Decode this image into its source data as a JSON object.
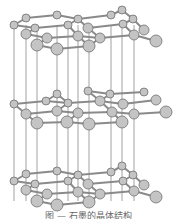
{
  "figure": {
    "title": "石墨的晶体结构",
    "caption": "图 — 石墨的晶体结构",
    "colors": {
      "atom_fill": "#c4c4c4",
      "atom_stroke": "#707070",
      "bond": "#8a8a8a",
      "interlayer_line": "#8a8a8a",
      "caption": "#666666"
    },
    "vertical_lines_x": [
      14,
      26,
      37,
      57,
      68,
      78,
      89,
      111,
      122,
      134
    ],
    "vertical_line_range": [
      25,
      201
    ],
    "layers": [
      {
        "name": "top",
        "atoms": [
          [
            14,
            25,
            4
          ],
          [
            26,
            18,
            4
          ],
          [
            57,
            15,
            4
          ],
          [
            78,
            19,
            4
          ],
          [
            111,
            15,
            4
          ],
          [
            122,
            10,
            4
          ],
          [
            133,
            19,
            4
          ],
          [
            144,
            30,
            5
          ],
          [
            68,
            25,
            4
          ],
          [
            88,
            28,
            5
          ],
          [
            123,
            24,
            4
          ],
          [
            35,
            28,
            4
          ],
          [
            26,
            34,
            5
          ],
          [
            47,
            38,
            5
          ],
          [
            78,
            36,
            5
          ],
          [
            100,
            38,
            5
          ],
          [
            134,
            35,
            5
          ],
          [
            156,
            41,
            6
          ],
          [
            37,
            45,
            6
          ],
          [
            57,
            49,
            6
          ],
          [
            89,
            46,
            6
          ]
        ],
        "bonds": [
          [
            0,
            1
          ],
          [
            1,
            2
          ],
          [
            2,
            3
          ],
          [
            3,
            8
          ],
          [
            8,
            11
          ],
          [
            11,
            0
          ],
          [
            3,
            4
          ],
          [
            4,
            5
          ],
          [
            5,
            6
          ],
          [
            6,
            10
          ],
          [
            10,
            9
          ],
          [
            9,
            3
          ],
          [
            6,
            7
          ],
          [
            10,
            16
          ],
          [
            11,
            12
          ],
          [
            12,
            13
          ],
          [
            13,
            14
          ],
          [
            14,
            8
          ],
          [
            14,
            15
          ],
          [
            15,
            16
          ],
          [
            16,
            17
          ],
          [
            13,
            18
          ],
          [
            18,
            19
          ],
          [
            19,
            20
          ],
          [
            20,
            14
          ],
          [
            9,
            15
          ],
          [
            15,
            20
          ]
        ]
      },
      {
        "name": "middle",
        "atoms": [
          [
            14,
            104,
            4
          ],
          [
            46,
            101,
            4
          ],
          [
            57,
            94,
            4
          ],
          [
            68,
            103,
            4
          ],
          [
            88,
            91,
            4
          ],
          [
            110,
            94,
            4
          ],
          [
            144,
            92,
            4
          ],
          [
            100,
            101,
            5
          ],
          [
            123,
            104,
            5
          ],
          [
            156,
            100,
            5
          ],
          [
            26,
            114,
            5
          ],
          [
            57,
            111,
            5
          ],
          [
            78,
            113,
            5
          ],
          [
            112,
            112,
            5
          ],
          [
            134,
            114,
            5
          ],
          [
            166,
            112,
            6
          ],
          [
            37,
            123,
            6
          ],
          [
            67,
            122,
            6
          ],
          [
            89,
            124,
            6
          ],
          [
            122,
            122,
            6
          ]
        ],
        "bonds": [
          [
            0,
            1
          ],
          [
            1,
            2
          ],
          [
            2,
            3
          ],
          [
            1,
            3
          ],
          [
            3,
            7
          ],
          [
            4,
            5
          ],
          [
            5,
            6
          ],
          [
            5,
            7
          ],
          [
            7,
            8
          ],
          [
            8,
            9
          ],
          [
            10,
            11
          ],
          [
            11,
            12
          ],
          [
            12,
            13
          ],
          [
            13,
            14
          ],
          [
            14,
            15
          ],
          [
            11,
            3
          ],
          [
            13,
            7
          ],
          [
            16,
            17
          ],
          [
            17,
            18
          ],
          [
            18,
            19
          ],
          [
            17,
            12
          ],
          [
            19,
            13
          ],
          [
            10,
            16
          ],
          [
            0,
            10
          ],
          [
            4,
            7
          ]
        ]
      },
      {
        "name": "bottom",
        "atoms": [
          [
            14,
            181,
            4
          ],
          [
            26,
            174,
            4
          ],
          [
            57,
            171,
            4
          ],
          [
            78,
            175,
            4
          ],
          [
            111,
            172,
            4
          ],
          [
            122,
            166,
            4
          ],
          [
            133,
            175,
            4
          ],
          [
            144,
            185,
            5
          ],
          [
            68,
            181,
            4
          ],
          [
            88,
            184,
            5
          ],
          [
            123,
            181,
            4
          ],
          [
            35,
            184,
            4
          ],
          [
            26,
            190,
            5
          ],
          [
            47,
            194,
            5
          ],
          [
            78,
            192,
            5
          ],
          [
            100,
            194,
            5
          ],
          [
            134,
            191,
            5
          ],
          [
            156,
            197,
            6
          ],
          [
            37,
            201,
            6
          ],
          [
            57,
            205,
            6
          ],
          [
            89,
            202,
            6
          ]
        ],
        "bonds": [
          [
            0,
            1
          ],
          [
            1,
            2
          ],
          [
            2,
            3
          ],
          [
            3,
            8
          ],
          [
            8,
            11
          ],
          [
            11,
            0
          ],
          [
            3,
            4
          ],
          [
            4,
            5
          ],
          [
            5,
            6
          ],
          [
            6,
            10
          ],
          [
            10,
            9
          ],
          [
            9,
            3
          ],
          [
            6,
            7
          ],
          [
            10,
            16
          ],
          [
            11,
            12
          ],
          [
            12,
            13
          ],
          [
            13,
            14
          ],
          [
            14,
            8
          ],
          [
            14,
            15
          ],
          [
            15,
            16
          ],
          [
            16,
            17
          ],
          [
            13,
            18
          ],
          [
            18,
            19
          ],
          [
            19,
            20
          ],
          [
            20,
            14
          ],
          [
            9,
            15
          ],
          [
            15,
            20
          ]
        ]
      }
    ]
  }
}
